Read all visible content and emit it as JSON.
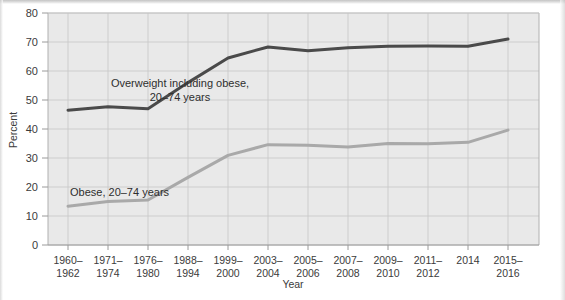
{
  "chart_data": {
    "type": "line",
    "title": "",
    "xlabel": "Year",
    "ylabel": "Percent",
    "ylim": [
      0,
      80
    ],
    "yticks": [
      0,
      10,
      20,
      30,
      40,
      50,
      60,
      70,
      80
    ],
    "grid": true,
    "legend_position": "inline-annotation",
    "categories": [
      "1960–\n1962",
      "1971–\n1974",
      "1976–\n1980",
      "1988–\n1994",
      "1999–\n2000",
      "2003–\n2004",
      "2005–\n2006",
      "2007–\n2008",
      "2009–\n2010",
      "2011–\n2012",
      "2014",
      "2015–\n2016"
    ],
    "categories_flat": [
      "1960-1962",
      "1971-1974",
      "1976-1980",
      "1988-1994",
      "1999-2000",
      "2003-2004",
      "2005-2006",
      "2007-2008",
      "2009-2010",
      "2011-2012",
      "2014",
      "2015-2016"
    ],
    "series": [
      {
        "name": "Overweight including obese, 20–74 years",
        "color": "#4a4a4a",
        "values": [
          46.5,
          47.7,
          47.0,
          56.0,
          64.5,
          68.3,
          67.0,
          68.0,
          68.5,
          68.6,
          68.5,
          71.0
        ]
      },
      {
        "name": "Obese, 20–74 years",
        "color": "#a9a9a9",
        "values": [
          13.4,
          15.0,
          15.5,
          23.3,
          30.9,
          34.6,
          34.4,
          33.8,
          35.0,
          34.9,
          35.4,
          39.6
        ]
      }
    ],
    "annotations": [
      {
        "id": "overweight-label",
        "lines": [
          "Overweight including obese,",
          "20–74 years"
        ],
        "x_value": 2.0,
        "y_value": 58.5
      },
      {
        "id": "obese-label",
        "lines": [
          "Obese, 20–74 years"
        ],
        "x_value": 1.55,
        "y_value": 20.2
      }
    ]
  },
  "axes": {
    "y_title": "Percent",
    "x_title": "Year",
    "y_tick_labels": [
      "0",
      "10",
      "20",
      "30",
      "40",
      "50",
      "60",
      "70",
      "80"
    ],
    "x_tick_labels": [
      {
        "line1": "1960–",
        "line2": "1962"
      },
      {
        "line1": "1971–",
        "line2": "1974"
      },
      {
        "line1": "1976–",
        "line2": "1980"
      },
      {
        "line1": "1988–",
        "line2": "1994"
      },
      {
        "line1": "1999–",
        "line2": "2000"
      },
      {
        "line1": "2003–",
        "line2": "2004"
      },
      {
        "line1": "2005–",
        "line2": "2006"
      },
      {
        "line1": "2007–",
        "line2": "2008"
      },
      {
        "line1": "2009–",
        "line2": "2010"
      },
      {
        "line1": "2011–",
        "line2": "2012"
      },
      {
        "line1": "2014",
        "line2": ""
      },
      {
        "line1": "2015–",
        "line2": "2016"
      }
    ]
  },
  "labels": {
    "overweight_line1": "Overweight including obese,",
    "overweight_line2": "20–74 years",
    "obese_line1": "Obese, 20–74 years"
  },
  "colors": {
    "plot_background": "#e9e9e9",
    "gridline": "#c9c9c9",
    "axis_line": "#b4b4b4",
    "series_overweight": "#4a4a4a",
    "series_obese": "#a9a9a9",
    "text": "#3b3b3b"
  }
}
